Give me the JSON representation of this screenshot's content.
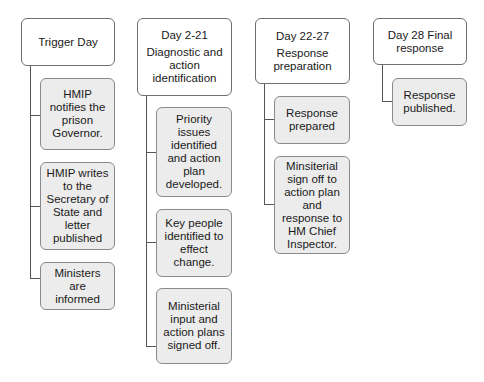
{
  "diagram": {
    "type": "hierarchy-timeline",
    "columns": [
      {
        "header": {
          "title": "Trigger Day",
          "subtitle": ""
        },
        "steps": [
          "HMIP notifies the prison Governor.",
          "HMIP writes to the Secretary of State and letter published",
          "Ministers are informed"
        ]
      },
      {
        "header": {
          "title": "Day 2-21",
          "subtitle": "Diagnostic and action identification"
        },
        "steps": [
          "Priority issues identified and action plan developed.",
          "Key people identified to effect change.",
          "Ministerial input and action plans signed off."
        ]
      },
      {
        "header": {
          "title": "Day 22-27",
          "subtitle": "Response preparation"
        },
        "steps": [
          "Response prepared",
          "Minsiterial sign off to action plan and response to HM Chief Inspector."
        ]
      },
      {
        "header": {
          "title": "Day 28 Final response",
          "subtitle": ""
        },
        "steps": [
          "Response published."
        ]
      }
    ],
    "colors": {
      "header_fill": "#ffffff",
      "step_fill": "#ececec",
      "border": "#6e6e6e",
      "connector": "#555555"
    }
  }
}
